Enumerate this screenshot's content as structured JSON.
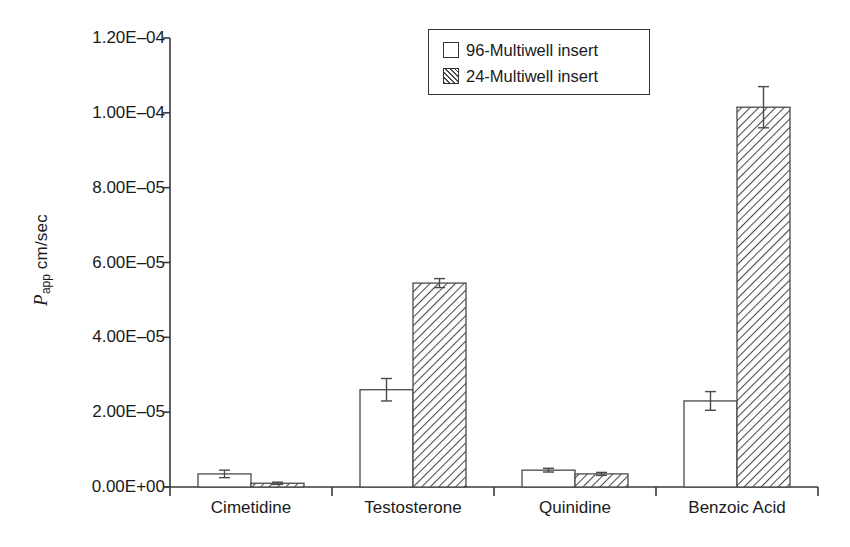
{
  "chart_data": {
    "type": "bar",
    "title": "",
    "subtitle": "",
    "xlabel": "",
    "ylabel": "Papp cm/sec",
    "ylabel_parts": {
      "variable": "P",
      "subscript": "app",
      "units": "cm/sec"
    },
    "categories": [
      "Cimetidine",
      "Testosterone",
      "Quinidine",
      "Benzoic Acid"
    ],
    "series": [
      {
        "name": "96-Multiwell insert",
        "fill": "white",
        "values": [
          3.5e-06,
          2.6e-05,
          4.5e-06,
          2.3e-05
        ],
        "errors": [
          1e-06,
          3e-06,
          5e-07,
          2.5e-06
        ]
      },
      {
        "name": "24-Multiwell insert",
        "fill": "hatched",
        "values": [
          1e-06,
          5.45e-05,
          3.5e-06,
          0.0001015
        ],
        "errors": [
          3e-07,
          1.2e-06,
          4e-07,
          5.5e-06
        ]
      }
    ],
    "ylim": [
      0,
      0.00012
    ],
    "yticks": [
      0,
      2e-05,
      4e-05,
      6e-05,
      8e-05,
      0.0001,
      0.00012
    ],
    "ytick_labels": [
      "0.00E+00",
      "2.00E–05",
      "4.00E–05",
      "6.00E–05",
      "8.00E–05",
      "1.00E–04",
      "1.20E–04"
    ],
    "grid": false,
    "legend_position": "top-center",
    "legend_entries": [
      "96-Multiwell insert",
      "24-Multiwell insert"
    ],
    "colors": {
      "axis": "#3a3a3a",
      "bar_outline": "#4a4a4a",
      "bar_white_fill": "#ffffff",
      "hatch_stroke": "#4a4a4a",
      "text": "#1a1a1a",
      "background": "#ffffff"
    }
  }
}
